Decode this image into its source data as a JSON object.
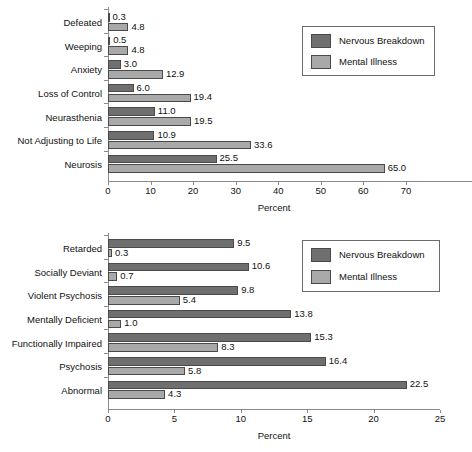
{
  "figure": {
    "background": "#ffffff",
    "colors": {
      "nervous_breakdown": "#6f6f6f",
      "mental_illness": "#a9a9a9",
      "axis": "#8a8a8a",
      "text": "#111111"
    }
  },
  "legend": {
    "entries": [
      {
        "label": "Nervous Breakdown",
        "color": "#6f6f6f",
        "key": "nb"
      },
      {
        "label": "Mental Illness",
        "color": "#a9a9a9",
        "key": "mi"
      }
    ]
  },
  "chart_data": [
    {
      "type": "bar",
      "orientation": "horizontal",
      "title": "",
      "xlabel": "Percent",
      "ylabel": "",
      "xlim": [
        0,
        78
      ],
      "xticks": [
        0,
        10,
        20,
        30,
        40,
        50,
        60,
        70
      ],
      "xticklabels": [
        "0",
        "10",
        "20",
        "30",
        "40",
        "50",
        "60",
        "70"
      ],
      "grid": false,
      "legend_position": "top-right",
      "categories": [
        "Defeated",
        "Weeping",
        "Anxiety",
        "Loss of Control",
        "Neurasthenia",
        "Not Adjusting to Life",
        "Neurosis"
      ],
      "series": [
        {
          "name": "Nervous Breakdown",
          "color": "#6f6f6f",
          "values": [
            0.3,
            0.5,
            3.0,
            6.0,
            11.0,
            10.9,
            25.5
          ],
          "labels": [
            "0.3",
            "0.5",
            "3.0",
            "6.0",
            "11.0",
            "10.9",
            "25.5"
          ]
        },
        {
          "name": "Mental Illness",
          "color": "#a9a9a9",
          "values": [
            4.8,
            4.8,
            12.9,
            19.4,
            19.5,
            33.6,
            65.0
          ],
          "labels": [
            "4.8",
            "4.8",
            "12.9",
            "19.4",
            "19.5",
            "33.6",
            "65.0"
          ]
        }
      ]
    },
    {
      "type": "bar",
      "orientation": "horizontal",
      "title": "",
      "xlabel": "Percent",
      "ylabel": "",
      "xlim": [
        0,
        25
      ],
      "xticks": [
        0,
        5,
        10,
        15,
        20,
        25
      ],
      "xticklabels": [
        "0",
        "5",
        "10",
        "15",
        "20",
        "25"
      ],
      "grid": false,
      "legend_position": "top-right",
      "categories": [
        "Retarded",
        "Socially Deviant",
        "Violent Psychosis",
        "Mentally Deficient",
        "Functionally Impaired",
        "Psychosis",
        "Abnormal"
      ],
      "series": [
        {
          "name": "Nervous Breakdown",
          "color": "#6f6f6f",
          "values": [
            9.5,
            10.6,
            9.8,
            13.8,
            15.3,
            16.4,
            22.5
          ],
          "labels": [
            "9.5",
            "10.6",
            "9.8",
            "13.8",
            "15.3",
            "16.4",
            "22.5"
          ]
        },
        {
          "name": "Mental Illness",
          "color": "#a9a9a9",
          "values": [
            0.3,
            0.7,
            5.4,
            1.0,
            8.3,
            5.8,
            4.3
          ],
          "labels": [
            "0.3",
            "0.7",
            "5.4",
            "1.0",
            "8.3",
            "5.8",
            "4.3"
          ]
        }
      ]
    }
  ]
}
